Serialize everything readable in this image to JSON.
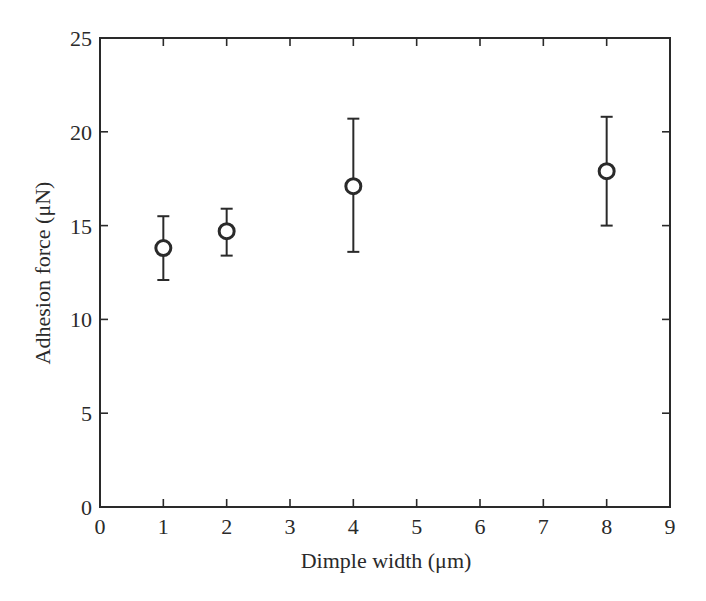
{
  "chart_data": {
    "type": "scatter",
    "title": "",
    "xlabel": "Dimple width (μm)",
    "ylabel": "Adhesion force (μN)",
    "xlim": [
      0,
      9
    ],
    "ylim": [
      0,
      25
    ],
    "xticks": [
      0,
      1,
      2,
      3,
      4,
      5,
      6,
      7,
      8,
      9
    ],
    "yticks": [
      0,
      5,
      10,
      15,
      20,
      25
    ],
    "grid": false,
    "legend": null,
    "marker": "open-circle",
    "series": [
      {
        "name": "Adhesion force",
        "x": [
          1,
          2,
          4,
          8
        ],
        "y": [
          13.8,
          14.7,
          17.1,
          17.9
        ],
        "error_low": [
          12.1,
          13.4,
          13.6,
          15.0
        ],
        "error_high": [
          15.5,
          15.9,
          20.7,
          20.8
        ]
      }
    ]
  },
  "colors": {
    "ink": "#2a2a2a",
    "background": "#ffffff",
    "marker_fill": "#ffffff"
  }
}
